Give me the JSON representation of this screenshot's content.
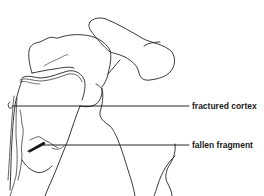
{
  "diagram": {
    "type": "anatomical-line-drawing",
    "line_color": "#222222",
    "background": "#ffffff",
    "labels": [
      {
        "id": "fractured-cortex",
        "text": "fractured cortex",
        "leader_from": [
          12,
          106
        ],
        "leader_to": [
          189,
          106
        ]
      },
      {
        "id": "fallen-fragment",
        "text": "fallen fragment",
        "leader_from": [
          42,
          145
        ],
        "leader_to": [
          189,
          145
        ]
      }
    ]
  }
}
